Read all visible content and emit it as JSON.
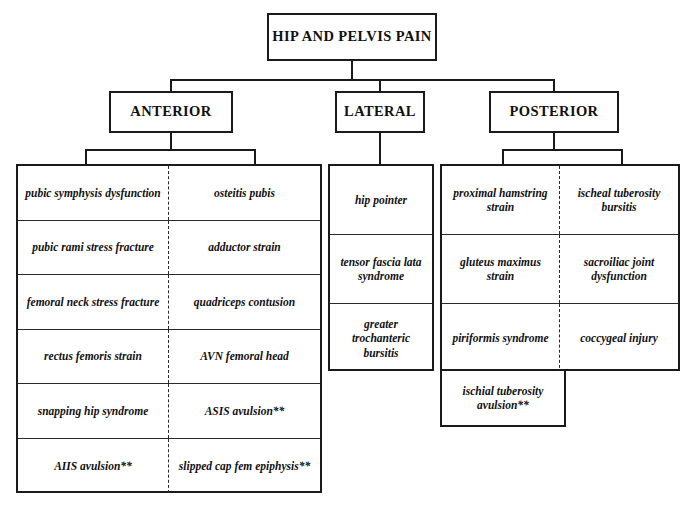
{
  "root": {
    "label": "HIP AND PELVIS PAIN"
  },
  "categories": [
    {
      "label": "ANTERIOR"
    },
    {
      "label": "LATERAL"
    },
    {
      "label": "POSTERIOR"
    }
  ],
  "anterior": {
    "rows": [
      {
        "left": "pubic symphysis dysfunction",
        "right": "osteitis pubis"
      },
      {
        "left": "pubic rami stress fracture",
        "right": "adductor strain"
      },
      {
        "left": "femoral neck stress fracture",
        "right": "quadriceps contusion"
      },
      {
        "left": "rectus femoris strain",
        "right": "AVN femoral head"
      },
      {
        "left": "snapping hip syndrome",
        "right": "ASIS avulsion**"
      },
      {
        "left": "AIIS avulsion**",
        "right": "slipped cap fem epiphysis**"
      }
    ]
  },
  "lateral": {
    "rows": [
      {
        "text": "hip pointer"
      },
      {
        "text": "tensor fascia lata syndrome"
      },
      {
        "text": "greater trochanteric bursitis"
      }
    ]
  },
  "posterior": {
    "rows": [
      {
        "left": "proximal hamstring strain",
        "right": "ischeal tuberosity bursitis"
      },
      {
        "left": "gluteus maximus strain",
        "right": "sacroiliac joint dysfunction"
      },
      {
        "left": "piriformis syndrome",
        "right": "coccygeal injury"
      }
    ],
    "extra": "ischial tuberosity avulsion**"
  },
  "colors": {
    "line": "#1a1a1a",
    "background": "#ffffff",
    "text": "#111111"
  }
}
